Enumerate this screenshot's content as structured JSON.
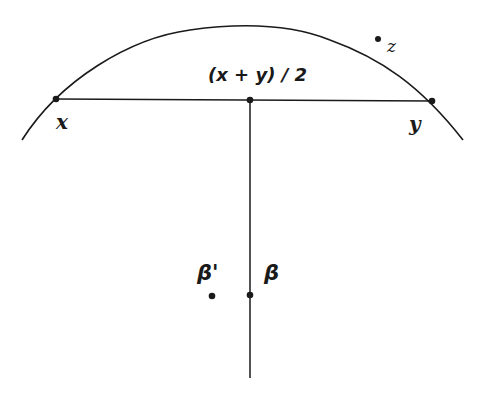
{
  "diagram": {
    "labels": {
      "midpoint": "(x + y) / 2",
      "x": "x",
      "y": "y",
      "z": "z",
      "beta": "β",
      "beta_prime": "β'"
    },
    "colors": {
      "stroke": "#1a1a1a",
      "background": "#ffffff"
    },
    "points": {
      "x": [
        56,
        99
      ],
      "y": [
        432,
        101
      ],
      "midpoint": [
        250,
        100
      ],
      "z": [
        378,
        40
      ],
      "beta": [
        250,
        295
      ],
      "beta_prime": [
        212,
        296
      ]
    }
  }
}
